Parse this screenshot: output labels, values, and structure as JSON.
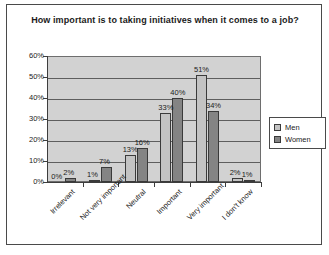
{
  "chart_data": {
    "type": "bar",
    "title": "How important is to taking initiatives when it comes to a job?",
    "xlabel": "",
    "ylabel": "",
    "ylim": [
      0,
      60
    ],
    "ytick_labels": [
      "60%",
      "50%",
      "40%",
      "30%",
      "20%",
      "10%",
      "0%"
    ],
    "ytick_values": [
      60,
      50,
      40,
      30,
      20,
      10,
      0
    ],
    "grid": true,
    "legend_position": "right",
    "categories": [
      "Irrelevant",
      "Not very important",
      "Neutral",
      "Important",
      "Very important",
      "I don't know"
    ],
    "series": [
      {
        "name": "Men",
        "color": "#c3c3c3",
        "values": [
          0,
          1,
          13,
          33,
          51,
          2
        ],
        "labels": [
          "0%",
          "1%",
          "13%",
          "33%",
          "51%",
          "2%"
        ]
      },
      {
        "name": "Women",
        "color": "#848484",
        "values": [
          2,
          7,
          16,
          40,
          34,
          1
        ],
        "labels": [
          "2%",
          "7%",
          "16%",
          "40%",
          "34%",
          "1%"
        ]
      }
    ]
  },
  "legend": {
    "items": [
      {
        "label": "Men"
      },
      {
        "label": "Women"
      }
    ]
  }
}
